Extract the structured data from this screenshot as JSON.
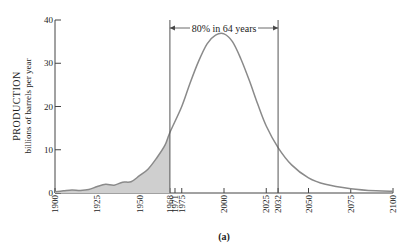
{
  "chart_data": {
    "type": "area",
    "title": "",
    "caption": "(a)",
    "xlabel": "",
    "ylabel": "PRODUCTION",
    "ylabel_sub": "billions of barrels per year",
    "xlim": [
      1900,
      2100
    ],
    "ylim": [
      0,
      40
    ],
    "y_ticks": [
      0,
      10,
      20,
      30,
      40
    ],
    "x_ticks": [
      1900,
      1925,
      1950,
      1968,
      1971,
      1975,
      2000,
      2025,
      2032,
      2050,
      2075,
      2100
    ],
    "grid": false,
    "annotation": {
      "text": "80% in 64 years",
      "from": 1968,
      "to": 2032
    },
    "shaded_region": {
      "from": 1900,
      "to": 1968,
      "label": "historical production"
    },
    "series": [
      {
        "name": "Production",
        "x": [
          1900,
          1905,
          1910,
          1915,
          1920,
          1925,
          1930,
          1935,
          1940,
          1945,
          1950,
          1955,
          1960,
          1965,
          1968,
          1975,
          1980,
          1985,
          1990,
          1995,
          2000,
          2005,
          2010,
          2015,
          2020,
          2025,
          2032,
          2040,
          2050,
          2060,
          2075,
          2090,
          2100
        ],
        "values": [
          0.3,
          0.5,
          0.7,
          0.6,
          0.8,
          1.5,
          2.0,
          1.8,
          2.5,
          2.6,
          4.0,
          5.5,
          8.0,
          11.0,
          14.0,
          20.0,
          25.5,
          30.5,
          34.5,
          36.5,
          36.8,
          35.0,
          31.0,
          26.0,
          20.5,
          15.5,
          10.5,
          6.5,
          3.5,
          2.0,
          1.0,
          0.5,
          0.4
        ]
      }
    ]
  }
}
